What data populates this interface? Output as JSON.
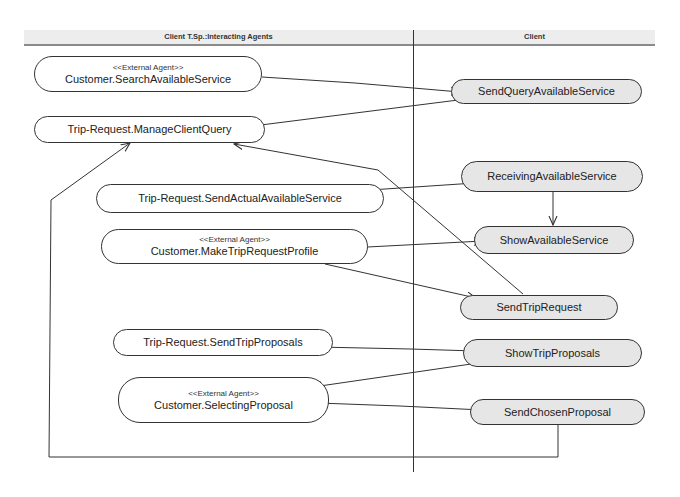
{
  "diagram": {
    "type": "uml-activity-swimlane",
    "lanes": [
      {
        "id": "lane-interacting-agents",
        "title": "Client T.Sp.:Interacting Agents"
      },
      {
        "id": "lane-client",
        "title": "Client"
      }
    ],
    "nodes": {
      "search_available_service": {
        "stereotype": "<<External Agent>>",
        "label": "Customer.SearchAvailableService",
        "lane": "Client T.Sp.:Interacting Agents"
      },
      "manage_client_query": {
        "stereotype": "",
        "label": "Trip-Request.ManageClientQuery",
        "lane": "Client T.Sp.:Interacting Agents"
      },
      "send_actual_available_service": {
        "stereotype": "",
        "label": "Trip-Request.SendActualAvailableService",
        "lane": "Client T.Sp.:Interacting Agents"
      },
      "make_trip_request_profile": {
        "stereotype": "<<External Agent>>",
        "label": "Customer.MakeTripRequestProfile",
        "lane": "Client T.Sp.:Interacting Agents"
      },
      "send_trip_proposals": {
        "stereotype": "",
        "label": "Trip-Request.SendTripProposals",
        "lane": "Client T.Sp.:Interacting Agents"
      },
      "selecting_proposal": {
        "stereotype": "<<External Agent>>",
        "label": "Customer.SelectingProposal",
        "lane": "Client T.Sp.:Interacting Agents"
      },
      "send_query_available_service": {
        "label": "SendQueryAvailableService",
        "lane": "Client"
      },
      "receiving_available_service": {
        "label": "ReceivingAvailableService",
        "lane": "Client"
      },
      "show_available_service": {
        "label": "ShowAvailableService",
        "lane": "Client"
      },
      "send_trip_request": {
        "label": "SendTripRequest",
        "lane": "Client"
      },
      "show_trip_proposals": {
        "label": "ShowTripProposals",
        "lane": "Client"
      },
      "send_chosen_proposal": {
        "label": "SendChosenProposal",
        "lane": "Client"
      }
    },
    "edges": [
      {
        "from": "Customer.SearchAvailableService",
        "to": "SendQueryAvailableService"
      },
      {
        "from": "SendQueryAvailableService",
        "to": "Trip-Request.ManageClientQuery"
      },
      {
        "from": "Trip-Request.SendActualAvailableService",
        "to": "ReceivingAvailableService"
      },
      {
        "from": "ReceivingAvailableService",
        "to": "ShowAvailableService"
      },
      {
        "from": "Customer.MakeTripRequestProfile",
        "to": "ShowAvailableService"
      },
      {
        "from": "Customer.MakeTripRequestProfile",
        "to": "SendTripRequest"
      },
      {
        "from": "SendTripRequest",
        "to": "Trip-Request.ManageClientQuery"
      },
      {
        "from": "Trip-Request.SendTripProposals",
        "to": "ShowTripProposals"
      },
      {
        "from": "ShowTripProposals",
        "to": "Customer.SelectingProposal"
      },
      {
        "from": "Customer.SelectingProposal",
        "to": "SendChosenProposal"
      },
      {
        "from": "SendChosenProposal",
        "to": "Trip-Request.ManageClientQuery"
      }
    ],
    "colors": {
      "line": "#333333",
      "client_node_fill": "#e6e6e6",
      "agent_node_fill": "#ffffff",
      "header_fill": "#ededed"
    }
  }
}
